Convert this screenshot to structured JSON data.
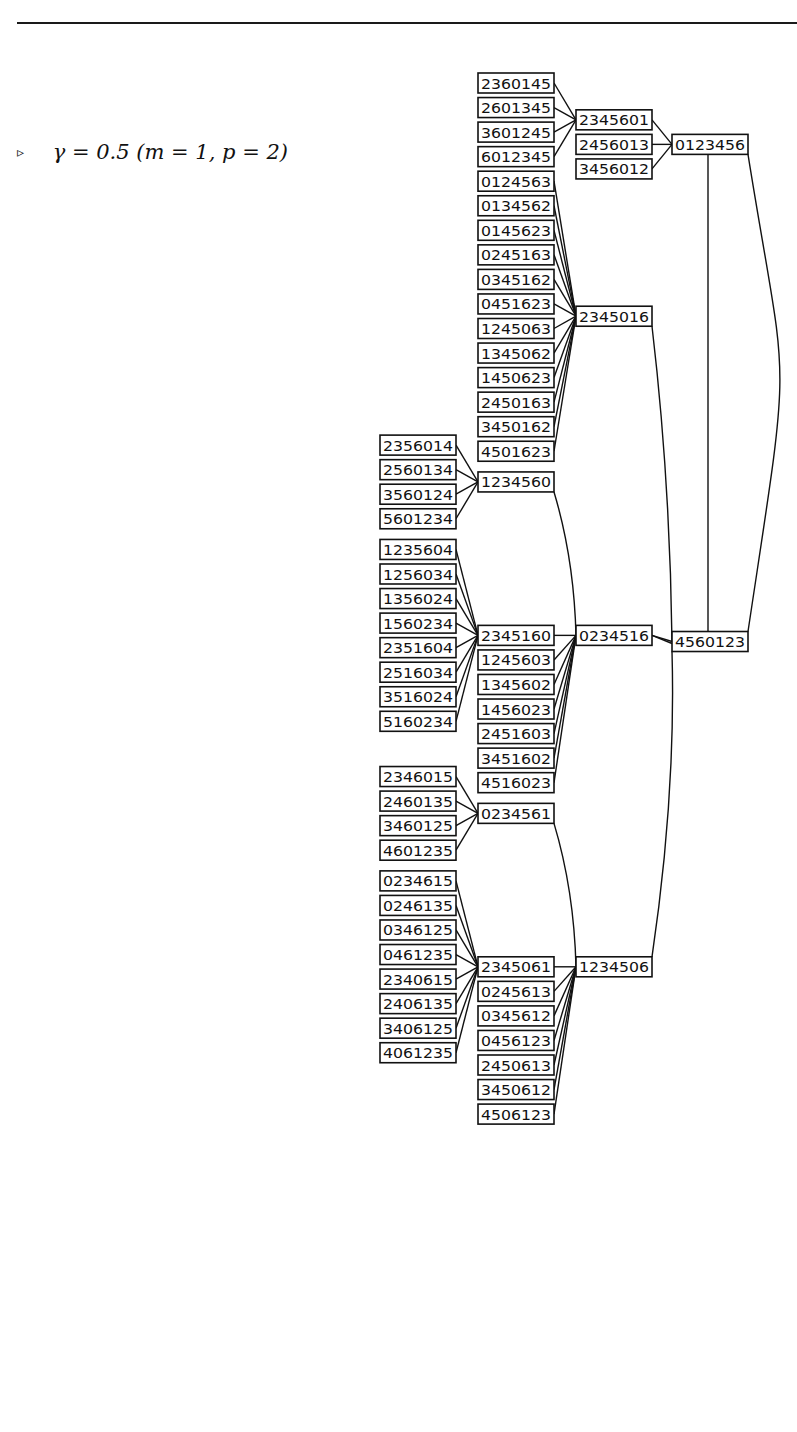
{
  "caption": {
    "marker": "▹",
    "text": "γ = 0.5 (m = 1, p = 2)"
  },
  "layout": {
    "row_pitch": 24.55,
    "first_row_center_y": 73,
    "box_width": 76,
    "box_height": 20,
    "column_x": [
      380,
      478,
      576,
      672
    ]
  },
  "diagram": {
    "root": "0123456",
    "nodes": [
      {
        "id": "2360145",
        "col": 1,
        "row": 0,
        "parent": "2345601"
      },
      {
        "id": "2601345",
        "col": 1,
        "row": 1,
        "parent": "2345601"
      },
      {
        "id": "3601245",
        "col": 1,
        "row": 2,
        "parent": "2345601"
      },
      {
        "id": "6012345",
        "col": 1,
        "row": 3,
        "parent": "2345601"
      },
      {
        "id": "2345601",
        "col": 2,
        "row": 1.5,
        "parent": "0123456"
      },
      {
        "id": "2456013",
        "col": 2,
        "row": 2.5,
        "parent": "0123456"
      },
      {
        "id": "3456012",
        "col": 2,
        "row": 3.5,
        "parent": "0123456"
      },
      {
        "id": "0123456",
        "col": 3,
        "row": 2.5,
        "parent": null
      },
      {
        "id": "0124563",
        "col": 1,
        "row": 4,
        "parent": "2345016"
      },
      {
        "id": "0134562",
        "col": 1,
        "row": 5,
        "parent": "2345016"
      },
      {
        "id": "0145623",
        "col": 1,
        "row": 6,
        "parent": "2345016"
      },
      {
        "id": "0245163",
        "col": 1,
        "row": 7,
        "parent": "2345016"
      },
      {
        "id": "0345162",
        "col": 1,
        "row": 8,
        "parent": "2345016"
      },
      {
        "id": "0451623",
        "col": 1,
        "row": 9,
        "parent": "2345016"
      },
      {
        "id": "1245063",
        "col": 1,
        "row": 10,
        "parent": "2345016"
      },
      {
        "id": "1345062",
        "col": 1,
        "row": 11,
        "parent": "2345016"
      },
      {
        "id": "1450623",
        "col": 1,
        "row": 12,
        "parent": "2345016"
      },
      {
        "id": "2450163",
        "col": 1,
        "row": 13,
        "parent": "2345016"
      },
      {
        "id": "3450162",
        "col": 1,
        "row": 14,
        "parent": "2345016"
      },
      {
        "id": "4501623",
        "col": 1,
        "row": 15,
        "parent": "2345016"
      },
      {
        "id": "2345016",
        "col": 2,
        "row": 9.5,
        "parent": "4560123"
      },
      {
        "id": "2356014",
        "col": 0,
        "row": 14.75,
        "parent": "1234560"
      },
      {
        "id": "2560134",
        "col": 0,
        "row": 15.75,
        "parent": "1234560"
      },
      {
        "id": "3560124",
        "col": 0,
        "row": 16.75,
        "parent": "1234560"
      },
      {
        "id": "5601234",
        "col": 0,
        "row": 17.75,
        "parent": "1234560"
      },
      {
        "id": "1234560",
        "col": 1,
        "row": 16.25,
        "parent": "0234516"
      },
      {
        "id": "1235604",
        "col": 0,
        "row": 19,
        "parent": "2345160"
      },
      {
        "id": "1256034",
        "col": 0,
        "row": 20,
        "parent": "2345160"
      },
      {
        "id": "1356024",
        "col": 0,
        "row": 21,
        "parent": "2345160"
      },
      {
        "id": "1560234",
        "col": 0,
        "row": 22,
        "parent": "2345160"
      },
      {
        "id": "2351604",
        "col": 0,
        "row": 23,
        "parent": "2345160"
      },
      {
        "id": "2516034",
        "col": 0,
        "row": 24,
        "parent": "2345160"
      },
      {
        "id": "3516024",
        "col": 0,
        "row": 25,
        "parent": "2345160"
      },
      {
        "id": "5160234",
        "col": 0,
        "row": 26,
        "parent": "2345160"
      },
      {
        "id": "2345160",
        "col": 1,
        "row": 22.5,
        "parent": "0234516"
      },
      {
        "id": "1245603",
        "col": 1,
        "row": 23.5,
        "parent": "0234516"
      },
      {
        "id": "1345602",
        "col": 1,
        "row": 24.5,
        "parent": "0234516"
      },
      {
        "id": "1456023",
        "col": 1,
        "row": 25.5,
        "parent": "0234516"
      },
      {
        "id": "2451603",
        "col": 1,
        "row": 26.5,
        "parent": "0234516"
      },
      {
        "id": "3451602",
        "col": 1,
        "row": 27.5,
        "parent": "0234516"
      },
      {
        "id": "4516023",
        "col": 1,
        "row": 28.5,
        "parent": "0234516"
      },
      {
        "id": "0234516",
        "col": 2,
        "row": 22.5,
        "parent": "4560123"
      },
      {
        "id": "4560123",
        "col": 3,
        "row": 22.75,
        "parent": "0123456"
      },
      {
        "id": "2346015",
        "col": 0,
        "row": 28.25,
        "parent": "0234561"
      },
      {
        "id": "2460135",
        "col": 0,
        "row": 29.25,
        "parent": "0234561"
      },
      {
        "id": "3460125",
        "col": 0,
        "row": 30.25,
        "parent": "0234561"
      },
      {
        "id": "4601235",
        "col": 0,
        "row": 31.25,
        "parent": "0234561"
      },
      {
        "id": "0234561",
        "col": 1,
        "row": 29.75,
        "parent": "1234506"
      },
      {
        "id": "0234615",
        "col": 0,
        "row": 32.5,
        "parent": "2345061"
      },
      {
        "id": "0246135",
        "col": 0,
        "row": 33.5,
        "parent": "2345061"
      },
      {
        "id": "0346125",
        "col": 0,
        "row": 34.5,
        "parent": "2345061"
      },
      {
        "id": "0461235",
        "col": 0,
        "row": 35.5,
        "parent": "2345061"
      },
      {
        "id": "2340615",
        "col": 0,
        "row": 36.5,
        "parent": "2345061"
      },
      {
        "id": "2406135",
        "col": 0,
        "row": 37.5,
        "parent": "2345061"
      },
      {
        "id": "3406125",
        "col": 0,
        "row": 38.5,
        "parent": "2345061"
      },
      {
        "id": "4061235",
        "col": 0,
        "row": 39.5,
        "parent": "2345061"
      },
      {
        "id": "2345061",
        "col": 1,
        "row": 36,
        "parent": "1234506"
      },
      {
        "id": "0245613",
        "col": 1,
        "row": 37,
        "parent": "1234506"
      },
      {
        "id": "0345612",
        "col": 1,
        "row": 38,
        "parent": "1234506"
      },
      {
        "id": "0456123",
        "col": 1,
        "row": 39,
        "parent": "1234506"
      },
      {
        "id": "2450613",
        "col": 1,
        "row": 40,
        "parent": "1234506"
      },
      {
        "id": "3450612",
        "col": 1,
        "row": 41,
        "parent": "1234506"
      },
      {
        "id": "4506123",
        "col": 1,
        "row": 42,
        "parent": "1234506"
      },
      {
        "id": "1234506",
        "col": 2,
        "row": 36,
        "parent": "4560123"
      }
    ],
    "extra_edges": [
      {
        "from": "0123456",
        "to": "4560123",
        "style": "straight-center"
      },
      {
        "from": "0123456",
        "to": "4560123",
        "style": "curve-right"
      },
      {
        "from": "2345016",
        "to": "4560123",
        "style": "long-vertical"
      },
      {
        "from": "1234560",
        "to": "0234516",
        "style": "long-vertical"
      },
      {
        "from": "0234561",
        "to": "1234506",
        "style": "long-vertical"
      },
      {
        "from": "1234506",
        "to": "4560123",
        "style": "long-vertical"
      }
    ]
  }
}
